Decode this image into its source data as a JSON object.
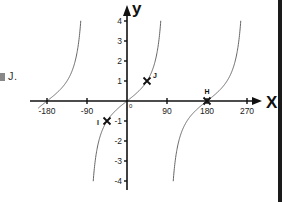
{
  "fragment": {
    "cut_label": "J."
  },
  "chart_data": {
    "type": "line",
    "title": "",
    "function": "y = tan(x)",
    "xlabel": "x",
    "ylabel": "y",
    "xlim": [
      -200,
      290
    ],
    "ylim": [
      -4.3,
      4.6
    ],
    "x_ticks": [
      -180,
      -90,
      90,
      180,
      270
    ],
    "x_tick_labels": [
      "-180",
      "-90",
      "90",
      "180",
      "270"
    ],
    "y_ticks": [
      4,
      3,
      2,
      1,
      -1,
      -2,
      -3,
      -4
    ],
    "y_tick_labels": [
      "4",
      "3",
      "2",
      "1",
      "-1",
      "-2",
      "-3",
      "-4"
    ],
    "origin_label": "0",
    "grid": false,
    "asymptotes": [
      -90,
      90
    ],
    "series": [
      {
        "name": "tan-branch-left",
        "x_range": [
          -200,
          -103
        ],
        "color": "#666666"
      },
      {
        "name": "tan-branch-middle",
        "x_range": [
          -76,
          76
        ],
        "color": "#666666"
      },
      {
        "name": "tan-branch-right",
        "x_range": [
          104,
          257
        ],
        "color": "#666666"
      }
    ],
    "points": [
      {
        "label": "J",
        "x": 45,
        "y": 1
      },
      {
        "label": "I",
        "x": -45,
        "y": -1
      },
      {
        "label": "H",
        "x": 180,
        "y": 0
      }
    ]
  }
}
